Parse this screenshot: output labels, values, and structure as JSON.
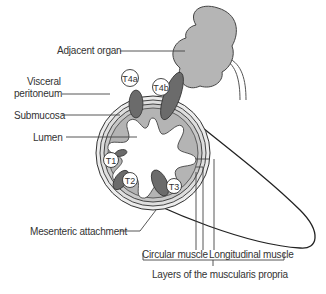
{
  "figure": {
    "colors": {
      "wall_fill": "#b8b8b8",
      "submucosa_fill": "#a9a9a9",
      "tumour_fill": "#6b6b6b",
      "organ_fill": "#b2b2b2",
      "outline": "#333333",
      "background": "#ffffff"
    }
  },
  "labels": {
    "adjacent_organ": "Adjacent organ",
    "visceral_peritoneum_line1": "Visceral",
    "visceral_peritoneum_line2": "peritoneum",
    "submucosa": "Submucosa",
    "lumen": "Lumen",
    "mesenteric_attachment": "Mesenteric attachment",
    "circular_muscle": "Circular muscle",
    "longitudinal_muscle": "Longitudinal muscle",
    "layers_caption": "Layers of the muscularis propria"
  },
  "stages": [
    {
      "id": "T1",
      "label": "T1"
    },
    {
      "id": "T2",
      "label": "T2"
    },
    {
      "id": "T3",
      "label": "T3"
    },
    {
      "id": "T4a",
      "label": "T4a"
    },
    {
      "id": "T4b",
      "label": "T4b"
    }
  ]
}
